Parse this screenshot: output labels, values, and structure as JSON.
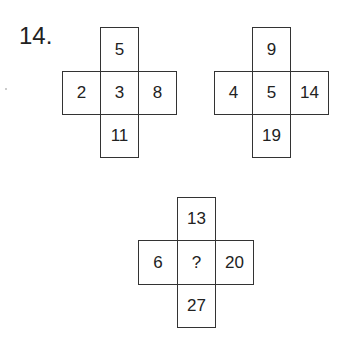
{
  "question_number": "14.",
  "puzzles": [
    {
      "top": "5",
      "left": "2",
      "center": "3",
      "right": "8",
      "bottom": "11"
    },
    {
      "top": "9",
      "left": "4",
      "center": "5",
      "right": "14",
      "bottom": "19"
    },
    {
      "top": "13",
      "left": "6",
      "center": "?",
      "right": "20",
      "bottom": "27"
    }
  ]
}
